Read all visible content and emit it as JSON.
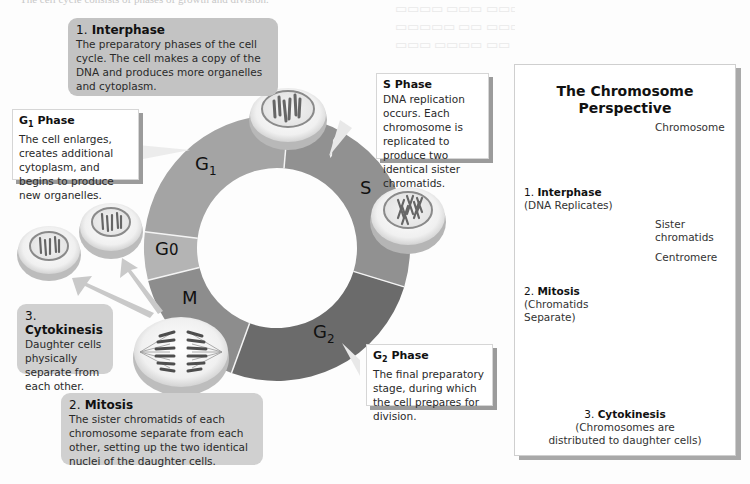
{
  "top_caption": "The cell cycle consists of phases of growth and division.",
  "ring": {
    "segments": [
      {
        "id": "G1",
        "label": "G",
        "sub": "1",
        "color": "#a4a4a4"
      },
      {
        "id": "S",
        "label": "S",
        "sub": "",
        "color": "#919191"
      },
      {
        "id": "G2",
        "label": "G",
        "sub": "2",
        "color": "#6b6b6b"
      },
      {
        "id": "M",
        "label": "M",
        "sub": "",
        "color": "#8d8d8d"
      },
      {
        "id": "G0",
        "label": "G",
        "sub": "0",
        "color": "#b4b4b4"
      }
    ]
  },
  "callouts": {
    "interphase": {
      "num": "1.",
      "title": "Interphase",
      "body": "The preparatory phases of the cell cycle. The cell makes a copy of the DNA and produces more organelles and cytoplasm."
    },
    "g1": {
      "title": "G",
      "sub": "1",
      "title_rest": " Phase",
      "body": "The cell enlarges, creates additional cytoplasm, and begins to produce new organelles."
    },
    "s": {
      "title": "S Phase",
      "body": "DNA replication occurs. Each chromosome is replicated to produce two identical sister chromatids."
    },
    "g2": {
      "title": "G",
      "sub": "2",
      "title_rest": " Phase",
      "body": "The final preparatory stage, during which the cell prepares for division."
    },
    "cytokinesis": {
      "num": "3.",
      "title": "Cytokinesis",
      "body": "Daughter cells physically separate from each other."
    },
    "mitosis": {
      "num": "2.",
      "title": "Mitosis",
      "body": "The sister chromatids of each chromosome separate from each other, setting up the two identical nuclei of the daughter cells."
    }
  },
  "panel": {
    "title_line1": "The Chromosome",
    "title_line2": "Perspective",
    "chromosome_label": "Chromosome",
    "interphase_num": "1.",
    "interphase_title": "Interphase",
    "interphase_note": "(DNA Replicates)",
    "sister_label_1": "Sister",
    "sister_label_2": "chromatids",
    "centromere_label": "Centromere",
    "mitosis_num": "2.",
    "mitosis_title": "Mitosis",
    "mitosis_note_1": "(Chromatids",
    "mitosis_note_2": "Separate)",
    "cytokinesis_num": "3.",
    "cytokinesis_title": "Cytokinesis",
    "cytokinesis_note_1": "(Chromosomes are",
    "cytokinesis_note_2": "distributed to daughter cells)"
  }
}
